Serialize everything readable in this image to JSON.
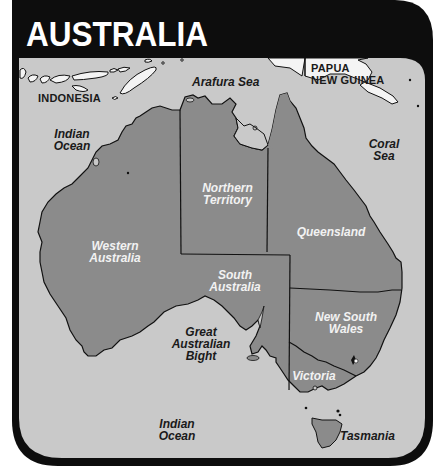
{
  "title": "AUSTRALIA",
  "colors": {
    "frame": "#0d0d0d",
    "ocean": "#c9c9c9",
    "land_australia": "#8b8b8b",
    "land_other": "#f4f4f4",
    "boundary": "#111111",
    "label_dark": "#1a1a1a",
    "label_light": "#f2f2f2"
  },
  "countries": {
    "indonesia": "INDONESIA",
    "png_line1": "PAPUA",
    "png_line2": "NEW GUINEA"
  },
  "water_bodies": {
    "arafura": "Arafura Sea",
    "indian_north_l1": "Indian",
    "indian_north_l2": "Ocean",
    "coral_l1": "Coral",
    "coral_l2": "Sea",
    "bight_l1": "Great",
    "bight_l2": "Australian",
    "bight_l3": "Bight",
    "indian_south_l1": "Indian",
    "indian_south_l2": "Ocean"
  },
  "states": {
    "wa_l1": "Western",
    "wa_l2": "Australia",
    "nt_l1": "Northern",
    "nt_l2": "Territory",
    "qld": "Queensland",
    "sa_l1": "South",
    "sa_l2": "Australia",
    "nsw_l1": "New South",
    "nsw_l2": "Wales",
    "vic": "Victoria",
    "tas": "Tasmania"
  }
}
